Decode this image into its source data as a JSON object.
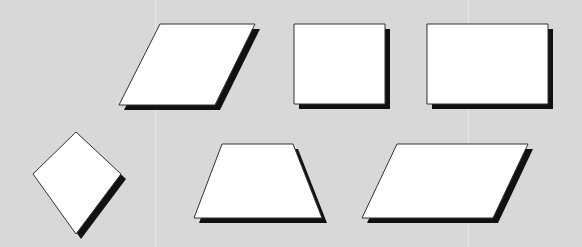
{
  "background": "#d8d8d8",
  "fill": "#ffffff",
  "stroke": "#333333",
  "shadow": "#111111",
  "guides": [
    155,
    468
  ],
  "shapes": [
    {
      "name": "parallelogram-shape",
      "points": [
        [
          160,
          24
        ],
        [
          255,
          24
        ],
        [
          215,
          105
        ],
        [
          119,
          105
        ]
      ]
    },
    {
      "name": "square-shape",
      "points": [
        [
          294,
          24
        ],
        [
          385,
          24
        ],
        [
          385,
          104
        ],
        [
          294,
          104
        ]
      ]
    },
    {
      "name": "rectangle-shape",
      "points": [
        [
          427,
          24
        ],
        [
          548,
          24
        ],
        [
          548,
          104
        ],
        [
          427,
          104
        ]
      ]
    },
    {
      "name": "kite-shape",
      "points": [
        [
          76,
          132
        ],
        [
          121,
          174
        ],
        [
          76,
          234
        ],
        [
          33,
          174
        ]
      ]
    },
    {
      "name": "trapezoid-shape",
      "points": [
        [
          222,
          144
        ],
        [
          293,
          144
        ],
        [
          322,
          218
        ],
        [
          194,
          218
        ]
      ]
    },
    {
      "name": "wide-parallelogram-shape",
      "points": [
        [
          397,
          144
        ],
        [
          528,
          144
        ],
        [
          493,
          218
        ],
        [
          362,
          218
        ]
      ]
    }
  ]
}
